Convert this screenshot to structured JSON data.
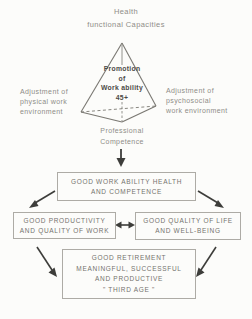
{
  "figure": {
    "pyramid": {
      "top": [
        "Health",
        "functional Capacities"
      ],
      "center": [
        "Promotion",
        "of",
        "Work ability",
        "45+"
      ],
      "left": [
        "Adjustment of",
        "physical work",
        "environment"
      ],
      "right": [
        "Adjustment of",
        "psychosocial",
        "work environment"
      ],
      "bottom": [
        "Professional",
        "Competence"
      ]
    },
    "boxes": {
      "outcome": [
        "GOOD WORK ABILITY HEALTH",
        "AND COMPETENCE"
      ],
      "productivity": [
        "GOOD PRODUCTIVITY",
        "AND QUALITY OF WORK"
      ],
      "quality_of_life": [
        "GOOD QUALITY OF LIFE",
        "AND WELL-BEING"
      ],
      "retirement": [
        "GOOD RETIREMENT",
        "MEANINGFUL, SUCCESSFUL",
        "AND PRODUCTIVE",
        "\" THIRD AGE \""
      ]
    },
    "colors": {
      "background": "#fcfcfa",
      "label_text": "#8f8d88",
      "box_text": "#75736e",
      "box_border": "#adaba5",
      "pyramid_line": "#7a7872",
      "arrow": "#3d3d3a"
    }
  }
}
